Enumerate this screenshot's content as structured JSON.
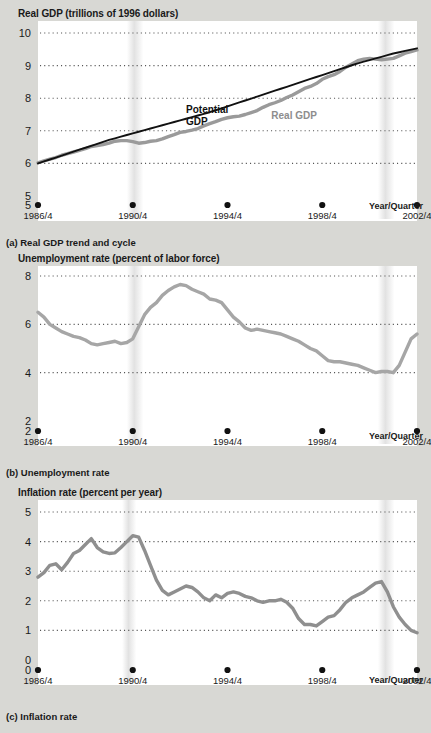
{
  "figure": {
    "background_color": "#d8d8d4",
    "plot_background_color": "#ffffff",
    "gridline_color": "#555555",
    "real_series_color": "#9a9a9a",
    "potential_line_color": "#111111",
    "recession_band_color": "#e2e2e2"
  },
  "panels": [
    {
      "id": "real-gdp",
      "title": "Real GDP (trillions of 1996 dollars)",
      "caption": "(a) Real GDP trend and cycle",
      "xaxis_note": "Year/Quarter"
    },
    {
      "id": "unemployment",
      "title": "Unemployment rate (percent of labor force)",
      "caption": "(b) Unemployment rate",
      "xaxis_note": "Year/Quarter"
    },
    {
      "id": "inflation",
      "title": "Inflation rate (percent per year)",
      "caption": "(c) Inflation rate",
      "xaxis_note": "Year/Quarter"
    }
  ],
  "chart_data": [
    {
      "type": "line",
      "title": "Real GDP (trillions of 1996 dollars)",
      "subtitle": "(a) Real GDP trend and cycle",
      "xlabel": "Year/Quarter",
      "ylabel": "Real GDP (trillions of 1996 dollars)",
      "ylim": [
        5,
        10
      ],
      "yticks": [
        5,
        6,
        7,
        8,
        9,
        10
      ],
      "xlim": [
        1986.75,
        2002.75
      ],
      "xticks": [
        1986.75,
        1990.75,
        1994.75,
        1998.75,
        2002.75
      ],
      "xticklabels": [
        "1986/4",
        "1990/4",
        "1994/4",
        "1998/4",
        "2002/4"
      ],
      "grid": true,
      "legend_position": "inline-annotations",
      "annotations": [
        {
          "text": "Potential GDP",
          "x": 1993.0,
          "y": 7.55,
          "color": "#111111"
        },
        {
          "text": "Real GDP",
          "x": 1996.6,
          "y": 7.35,
          "color": "#8d8d8d"
        }
      ],
      "recession_bands": [
        {
          "start": 1990.5,
          "end": 1991.2
        },
        {
          "start": 2001.1,
          "end": 2001.8
        }
      ],
      "x": [
        1986.75,
        1987.0,
        1987.25,
        1987.5,
        1987.75,
        1988.0,
        1988.25,
        1988.5,
        1988.75,
        1989.0,
        1989.25,
        1989.5,
        1989.75,
        1990.0,
        1990.25,
        1990.5,
        1990.75,
        1991.0,
        1991.25,
        1991.5,
        1991.75,
        1992.0,
        1992.25,
        1992.5,
        1992.75,
        1993.0,
        1993.25,
        1993.5,
        1993.75,
        1994.0,
        1994.25,
        1994.5,
        1994.75,
        1995.0,
        1995.25,
        1995.5,
        1995.75,
        1996.0,
        1996.25,
        1996.5,
        1996.75,
        1997.0,
        1997.25,
        1997.5,
        1997.75,
        1998.0,
        1998.25,
        1998.5,
        1998.75,
        1999.0,
        1999.25,
        1999.5,
        1999.75,
        2000.0,
        2000.25,
        2000.5,
        2000.75,
        2001.0,
        2001.25,
        2001.5,
        2001.75,
        2002.0,
        2002.25,
        2002.5,
        2002.75
      ],
      "series": [
        {
          "name": "Real GDP",
          "color": "#9a9a9a",
          "values": [
            6.02,
            6.08,
            6.13,
            6.18,
            6.25,
            6.3,
            6.35,
            6.4,
            6.45,
            6.52,
            6.55,
            6.58,
            6.62,
            6.68,
            6.7,
            6.7,
            6.67,
            6.62,
            6.64,
            6.68,
            6.7,
            6.75,
            6.82,
            6.88,
            6.95,
            6.98,
            7.02,
            7.07,
            7.15,
            7.22,
            7.28,
            7.35,
            7.4,
            7.43,
            7.45,
            7.5,
            7.56,
            7.62,
            7.72,
            7.8,
            7.86,
            7.93,
            8.02,
            8.1,
            8.2,
            8.3,
            8.36,
            8.45,
            8.58,
            8.66,
            8.72,
            8.82,
            8.95,
            9.05,
            9.15,
            9.2,
            9.22,
            9.2,
            9.18,
            9.2,
            9.22,
            9.3,
            9.38,
            9.43,
            9.48
          ]
        },
        {
          "name": "Potential GDP",
          "color": "#111111",
          "values": [
            6.0,
            6.06,
            6.12,
            6.18,
            6.24,
            6.3,
            6.36,
            6.42,
            6.48,
            6.54,
            6.6,
            6.66,
            6.72,
            6.77,
            6.82,
            6.87,
            6.92,
            6.97,
            7.02,
            7.07,
            7.12,
            7.17,
            7.22,
            7.27,
            7.32,
            7.37,
            7.42,
            7.47,
            7.52,
            7.57,
            7.63,
            7.69,
            7.75,
            7.81,
            7.87,
            7.93,
            7.99,
            8.05,
            8.11,
            8.17,
            8.23,
            8.29,
            8.35,
            8.41,
            8.47,
            8.53,
            8.59,
            8.65,
            8.71,
            8.77,
            8.83,
            8.89,
            8.95,
            9.01,
            9.07,
            9.12,
            9.17,
            9.22,
            9.27,
            9.32,
            9.37,
            9.41,
            9.45,
            9.49,
            9.53
          ]
        }
      ]
    },
    {
      "type": "line",
      "title": "Unemployment rate (percent of labor force)",
      "subtitle": "(b) Unemployment rate",
      "xlabel": "Year/Quarter",
      "ylabel": "Unemployment rate (percent of labor force)",
      "ylim": [
        2,
        8
      ],
      "yticks": [
        2,
        4,
        6,
        8
      ],
      "xlim": [
        1986.75,
        2002.75
      ],
      "xticks": [
        1986.75,
        1990.75,
        1994.75,
        1998.75,
        2002.75
      ],
      "xticklabels": [
        "1986/4",
        "1990/4",
        "1994/4",
        "1998/4",
        "2002/4"
      ],
      "grid": true,
      "legend_position": "none",
      "recession_bands": [
        {
          "start": 1990.5,
          "end": 1991.2
        },
        {
          "start": 2001.1,
          "end": 2001.8
        }
      ],
      "x": [
        1986.75,
        1987.0,
        1987.25,
        1987.5,
        1987.75,
        1988.0,
        1988.25,
        1988.5,
        1988.75,
        1989.0,
        1989.25,
        1989.5,
        1989.75,
        1990.0,
        1990.25,
        1990.5,
        1990.75,
        1991.0,
        1991.25,
        1991.5,
        1991.75,
        1992.0,
        1992.25,
        1992.5,
        1992.75,
        1993.0,
        1993.25,
        1993.5,
        1993.75,
        1994.0,
        1994.25,
        1994.5,
        1994.75,
        1995.0,
        1995.25,
        1995.5,
        1995.75,
        1996.0,
        1996.25,
        1996.5,
        1996.75,
        1997.0,
        1997.25,
        1997.5,
        1997.75,
        1998.0,
        1998.25,
        1998.5,
        1998.75,
        1999.0,
        1999.25,
        1999.5,
        1999.75,
        2000.0,
        2000.25,
        2000.5,
        2000.75,
        2001.0,
        2001.25,
        2001.5,
        2001.75,
        2002.0,
        2002.25,
        2002.5,
        2002.75
      ],
      "series": [
        {
          "name": "Unemployment rate",
          "color": "#a6a6a6",
          "values": [
            6.5,
            6.3,
            6.0,
            5.85,
            5.7,
            5.6,
            5.5,
            5.45,
            5.35,
            5.2,
            5.15,
            5.2,
            5.25,
            5.3,
            5.2,
            5.25,
            5.4,
            5.9,
            6.4,
            6.7,
            6.9,
            7.2,
            7.4,
            7.55,
            7.65,
            7.6,
            7.45,
            7.35,
            7.25,
            7.05,
            7.0,
            6.9,
            6.6,
            6.3,
            6.1,
            5.85,
            5.75,
            5.8,
            5.75,
            5.7,
            5.65,
            5.6,
            5.5,
            5.4,
            5.3,
            5.15,
            5.0,
            4.9,
            4.7,
            4.5,
            4.45,
            4.45,
            4.4,
            4.35,
            4.3,
            4.2,
            4.1,
            4.0,
            4.05,
            4.05,
            4.0,
            4.3,
            4.85,
            5.4,
            5.6
          ]
        }
      ]
    },
    {
      "type": "line",
      "title": "Inflation rate (percent per year)",
      "subtitle": "(c) Inflation rate",
      "xlabel": "Year/Quarter",
      "ylabel": "Inflation rate (percent per year)",
      "ylim": [
        0,
        5
      ],
      "yticks": [
        0,
        1,
        2,
        3,
        4,
        5
      ],
      "xlim": [
        1986.75,
        2002.75
      ],
      "xticks": [
        1986.75,
        1990.75,
        1994.75,
        1998.75,
        2002.75
      ],
      "xticklabels": [
        "1986/4",
        "1990/4",
        "1994/4",
        "1998/4",
        "2002/4"
      ],
      "grid": true,
      "legend_position": "none",
      "recession_bands": [
        {
          "start": 1990.3,
          "end": 1990.9
        },
        {
          "start": 2001.1,
          "end": 2001.8
        }
      ],
      "x": [
        1986.75,
        1987.0,
        1987.25,
        1987.5,
        1987.75,
        1988.0,
        1988.25,
        1988.5,
        1988.75,
        1989.0,
        1989.25,
        1989.5,
        1989.75,
        1990.0,
        1990.25,
        1990.5,
        1990.75,
        1991.0,
        1991.25,
        1991.5,
        1991.75,
        1992.0,
        1992.25,
        1992.5,
        1992.75,
        1993.0,
        1993.25,
        1993.5,
        1993.75,
        1994.0,
        1994.25,
        1994.5,
        1994.75,
        1995.0,
        1995.25,
        1995.5,
        1995.75,
        1996.0,
        1996.25,
        1996.5,
        1996.75,
        1997.0,
        1997.25,
        1997.5,
        1997.75,
        1998.0,
        1998.25,
        1998.5,
        1998.75,
        1999.0,
        1999.25,
        1999.5,
        1999.75,
        2000.0,
        2000.25,
        2000.5,
        2000.75,
        2001.0,
        2001.25,
        2001.5,
        2001.75,
        2002.0,
        2002.25,
        2002.5,
        2002.75
      ],
      "series": [
        {
          "name": "Inflation rate",
          "color": "#8f8f8f",
          "values": [
            2.8,
            2.95,
            3.2,
            3.25,
            3.05,
            3.3,
            3.6,
            3.7,
            3.9,
            4.1,
            3.8,
            3.65,
            3.6,
            3.62,
            3.8,
            4.0,
            4.2,
            4.15,
            3.7,
            3.2,
            2.7,
            2.35,
            2.2,
            2.3,
            2.4,
            2.5,
            2.45,
            2.3,
            2.1,
            2.0,
            2.2,
            2.1,
            2.25,
            2.3,
            2.25,
            2.15,
            2.1,
            2.0,
            1.95,
            2.0,
            2.0,
            2.05,
            1.95,
            1.75,
            1.4,
            1.2,
            1.2,
            1.15,
            1.3,
            1.45,
            1.5,
            1.7,
            1.95,
            2.1,
            2.2,
            2.3,
            2.45,
            2.6,
            2.65,
            2.3,
            1.8,
            1.45,
            1.2,
            1.0,
            0.92
          ]
        }
      ]
    }
  ]
}
